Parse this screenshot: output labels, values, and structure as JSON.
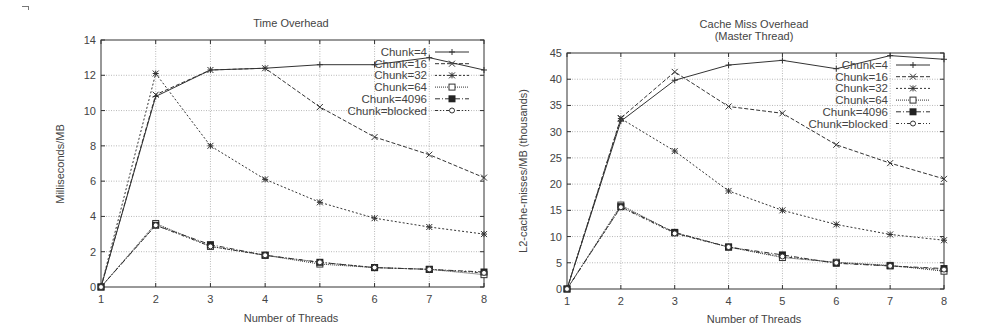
{
  "chart_data": [
    {
      "type": "line",
      "title": "Time Overhead",
      "subtitle": "",
      "xlabel": "Number of Threads",
      "ylabel": "Milliseconds/MB",
      "x": [
        1,
        2,
        3,
        4,
        5,
        6,
        7,
        8
      ],
      "xlim": [
        1,
        8
      ],
      "ylim": [
        0,
        14
      ],
      "yticks": [
        0,
        2,
        4,
        6,
        8,
        10,
        12,
        14
      ],
      "xticks": [
        1,
        2,
        3,
        4,
        5,
        6,
        7,
        8
      ],
      "grid": true,
      "legend_position": "top-right inside",
      "series": [
        {
          "name": "Chunk=4",
          "marker": "plus",
          "dash": "solid",
          "values": [
            0,
            10.8,
            12.3,
            12.4,
            12.6,
            12.6,
            13.0,
            12.3
          ]
        },
        {
          "name": "Chunk=16",
          "marker": "cross",
          "dash": "dashed",
          "values": [
            0,
            10.9,
            12.3,
            12.4,
            10.2,
            8.5,
            7.5,
            6.2
          ]
        },
        {
          "name": "Chunk=32",
          "marker": "star",
          "dash": "dotted",
          "values": [
            0,
            12.1,
            8.0,
            6.1,
            4.8,
            3.9,
            3.4,
            3.0
          ]
        },
        {
          "name": "Chunk=64",
          "marker": "open-square",
          "dash": "dotted-fine",
          "values": [
            0,
            3.6,
            2.3,
            1.8,
            1.3,
            1.1,
            1.0,
            0.7
          ]
        },
        {
          "name": "Chunk=4096",
          "marker": "filled-square",
          "dash": "dash-dot",
          "values": [
            0,
            3.5,
            2.4,
            1.8,
            1.4,
            1.1,
            1.0,
            0.85
          ]
        },
        {
          "name": "Chunk=blocked",
          "marker": "open-circle",
          "dash": "dash-dot-dot",
          "values": [
            0,
            3.5,
            2.3,
            1.8,
            1.4,
            1.1,
            1.0,
            0.8
          ]
        }
      ]
    },
    {
      "type": "line",
      "title": "Cache Miss Overhead",
      "subtitle": "(Master Thread)",
      "xlabel": "Number of Threads",
      "ylabel": "L2-cache-misses/MB (thousands)",
      "x": [
        1,
        2,
        3,
        4,
        5,
        6,
        7,
        8
      ],
      "xlim": [
        1,
        8
      ],
      "ylim": [
        0,
        45
      ],
      "yticks": [
        0,
        5,
        10,
        15,
        20,
        25,
        30,
        35,
        40,
        45
      ],
      "xticks": [
        1,
        2,
        3,
        4,
        5,
        6,
        7,
        8
      ],
      "grid": true,
      "legend_position": "top-right inside",
      "series": [
        {
          "name": "Chunk=4",
          "marker": "plus",
          "dash": "solid",
          "values": [
            0,
            32.0,
            39.8,
            42.7,
            43.6,
            42.0,
            44.5,
            43.8
          ]
        },
        {
          "name": "Chunk=16",
          "marker": "cross",
          "dash": "dashed",
          "values": [
            0,
            32.6,
            41.4,
            34.8,
            33.5,
            27.5,
            24.0,
            21.0
          ]
        },
        {
          "name": "Chunk=32",
          "marker": "star",
          "dash": "dotted",
          "values": [
            0,
            32.5,
            26.3,
            18.7,
            15.0,
            12.3,
            10.4,
            9.3
          ]
        },
        {
          "name": "Chunk=64",
          "marker": "open-square",
          "dash": "dotted-fine",
          "values": [
            0,
            16.0,
            10.7,
            8.0,
            6.0,
            5.1,
            4.5,
            3.4
          ]
        },
        {
          "name": "Chunk=4096",
          "marker": "filled-square",
          "dash": "dash-dot",
          "values": [
            0,
            15.7,
            10.8,
            8.0,
            6.5,
            4.9,
            4.4,
            3.9
          ]
        },
        {
          "name": "Chunk=blocked",
          "marker": "open-circle",
          "dash": "dash-dot-dot",
          "values": [
            0,
            15.6,
            10.6,
            8.0,
            6.2,
            5.0,
            4.4,
            3.7
          ]
        }
      ]
    }
  ],
  "charts": {
    "left": {
      "title": "Time Overhead",
      "ylabel": "Milliseconds/MB",
      "xlabel": "Number of Threads"
    },
    "right": {
      "title": "Cache Miss Overhead",
      "subtitle": "(Master Thread)",
      "ylabel": "L2-cache-misses/MB (thousands)",
      "xlabel": "Number of Threads"
    }
  },
  "colors": {
    "line": "#333333",
    "grid": "#9a9a9a",
    "axis": "#333333",
    "text": "#444444",
    "background": "#ffffff"
  }
}
